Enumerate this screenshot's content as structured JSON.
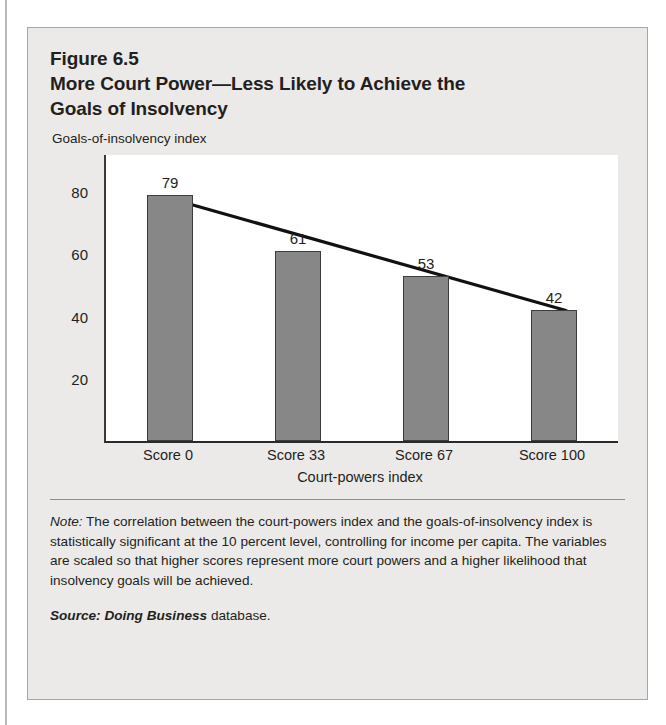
{
  "figure": {
    "number_line": "Figure 6.5",
    "title_line_1": "More Court Power—Less Likely to Achieve the",
    "title_line_2": "Goals of Insolvency"
  },
  "note": {
    "label": "Note:",
    "text": " The correlation between the court-powers index and the goals-of-insolvency index is statistically significant at the 10 percent level, controlling for income per capita. The variables are scaled so that higher scores represent more court powers and a higher likelihood that insolvency goals will be achieved."
  },
  "source": {
    "label": "Source:",
    "publication": " Doing Business",
    "suffix": " database."
  },
  "colors": {
    "card_background": "#eceae8",
    "card_border": "#a8a6a4",
    "plot_background": "#ffffff",
    "bar_fill": "#878787",
    "bar_stroke": "#3d3d3d",
    "trendline": "#111111",
    "text": "#231f20"
  },
  "chart_data": {
    "type": "bar",
    "title": "More Court Power—Less Likely to Achieve the Goals of Insolvency",
    "subtitle": "Figure 6.5",
    "categories": [
      "Score 0",
      "Score 33",
      "Score 67",
      "Score 100"
    ],
    "values": [
      79,
      61,
      53,
      42
    ],
    "xlabel": "Court-powers index",
    "ylabel": "Goals-of-insolvency index",
    "ylim": [
      0,
      92
    ],
    "yticks": [
      20,
      40,
      60,
      80
    ],
    "grid": false,
    "legend": false,
    "data_labels": true,
    "series": [
      {
        "name": "Goals-of-insolvency index",
        "type": "bar",
        "values": [
          79,
          61,
          53,
          42
        ]
      },
      {
        "name": "trendline",
        "type": "line",
        "x": [
          "Score 0",
          "Score 100"
        ],
        "values": [
          78,
          42
        ]
      }
    ]
  }
}
